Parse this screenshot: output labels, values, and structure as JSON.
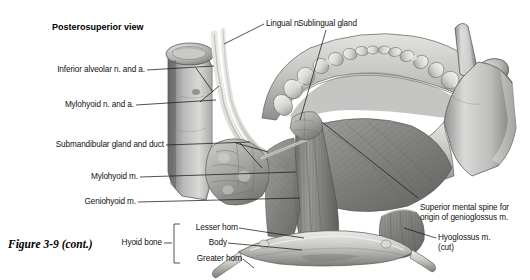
{
  "figure": {
    "view_heading": "Posterosuperior view",
    "caption": "Figure 3-9 (cont.)",
    "background_color": "#ffffff",
    "line_color": "#1a1a1a",
    "text_color": "#111111"
  },
  "labels": {
    "left": [
      {
        "id": "inferior-alveolar",
        "text": "Inferior alveolar n. and a."
      },
      {
        "id": "mylohyoid-na",
        "text": "Mylohyoid n. and a."
      },
      {
        "id": "submandibular-gland-duct",
        "text": "Submandibular gland and duct"
      },
      {
        "id": "mylohyoid-m",
        "text": "Mylohyoid m."
      },
      {
        "id": "geniohyoid-m",
        "text": "Geniohyoid m."
      }
    ],
    "top": [
      {
        "id": "lingual-n",
        "text": "Lingual n."
      },
      {
        "id": "sublingual-gland",
        "text": "Sublingual gland"
      }
    ],
    "right": [
      {
        "id": "superior-mental-spine",
        "line1": "Superior mental spine for",
        "line2": "origin of genioglossus m."
      },
      {
        "id": "hyoglossus",
        "line1": "Hyoglossus",
        "line2": "m. (cut)"
      }
    ],
    "hyoid_group": {
      "group_label": "Hyoid bone",
      "parts": [
        {
          "id": "lesser-horn",
          "text": "Lesser horn"
        },
        {
          "id": "body",
          "text": "Body"
        },
        {
          "id": "greater-horn",
          "text": "Greater horn"
        }
      ]
    }
  }
}
